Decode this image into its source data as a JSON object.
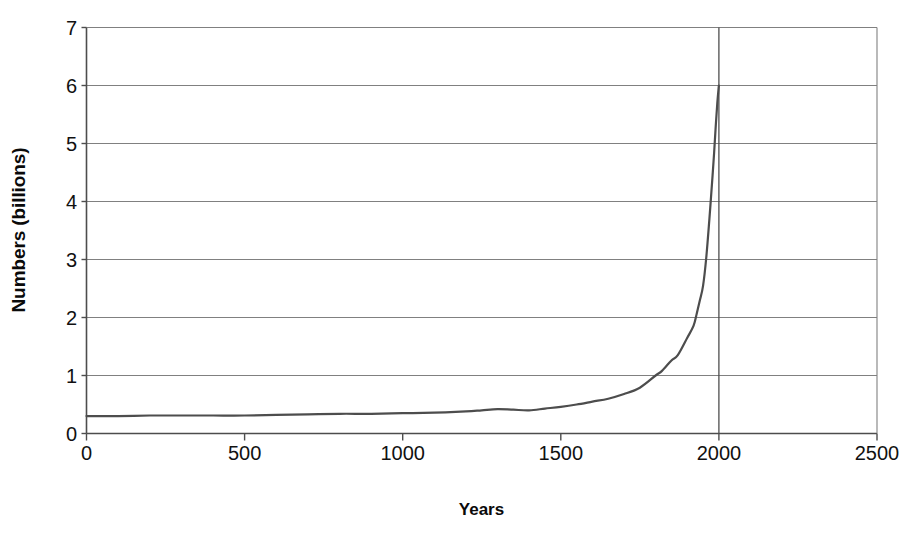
{
  "chart_data": {
    "type": "line",
    "title": "",
    "xlabel": "Years",
    "ylabel": "Numbers (billions)",
    "xlim": [
      0,
      2500
    ],
    "ylim": [
      0,
      7
    ],
    "grid": true,
    "legend": false,
    "xticks": [
      0,
      500,
      1000,
      1500,
      2000,
      2500
    ],
    "xtick_labels": [
      "0",
      "500",
      "1000",
      "1500",
      "2000",
      "2500"
    ],
    "yticks": [
      0,
      1,
      2,
      3,
      4,
      5,
      6,
      7
    ],
    "ytick_labels": [
      "0",
      "1",
      "2",
      "3",
      "4",
      "5",
      "6",
      "7"
    ],
    "line_color": "#4d4d4d",
    "grid_color": "#808080",
    "axis_color": "#4d4d4d",
    "background_color": "#ffffff",
    "annotations": [
      {
        "name": "present-day-marker",
        "kind": "vertical-line",
        "x": 2000,
        "label": ""
      }
    ],
    "series": [
      {
        "name": "World population",
        "x": [
          0,
          100,
          200,
          300,
          400,
          500,
          600,
          700,
          800,
          900,
          1000,
          1100,
          1200,
          1250,
          1300,
          1350,
          1400,
          1450,
          1500,
          1550,
          1600,
          1650,
          1700,
          1750,
          1800,
          1820,
          1850,
          1870,
          1900,
          1920,
          1930,
          1940,
          1950,
          1960,
          1970,
          1975,
          1980,
          1985,
          1990,
          1995,
          1999,
          2000
        ],
        "y": [
          0.3,
          0.3,
          0.31,
          0.31,
          0.31,
          0.31,
          0.32,
          0.33,
          0.34,
          0.34,
          0.35,
          0.36,
          0.38,
          0.4,
          0.42,
          0.41,
          0.4,
          0.43,
          0.46,
          0.5,
          0.55,
          0.6,
          0.68,
          0.79,
          1.0,
          1.08,
          1.26,
          1.35,
          1.65,
          1.86,
          2.07,
          2.3,
          2.55,
          3.03,
          3.7,
          4.07,
          4.45,
          4.85,
          5.3,
          5.7,
          5.95,
          6.0
        ]
      }
    ]
  },
  "axes": {
    "y_title": "Numbers (billions)",
    "x_title": "Years"
  }
}
